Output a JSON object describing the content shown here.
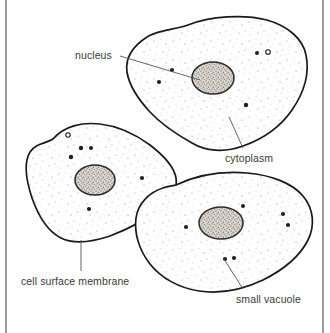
{
  "figure": {
    "background_color": "#ffffff",
    "ink_color": "#1a1a1a",
    "label_color": "#3a3a3a",
    "nucleus_fill_color": "#b9b5ad",
    "stipple_color": "#8d8d8d",
    "scan_rule_color": "#6f6f6f"
  },
  "labels": {
    "nucleus": "nucleus",
    "cytoplasm": "cytoplasm",
    "cell_surface_membrane": "cell surface membrane",
    "small_vacuole": "small vacuole"
  },
  "cells": [
    {
      "name": "top-cell",
      "nucleus_center": [
        213,
        78
      ],
      "nucleus_radius": [
        21,
        16
      ],
      "vacuoles": [
        [
          172,
          70
        ],
        [
          159,
          82
        ],
        [
          257,
          53
        ],
        [
          268,
          52
        ],
        [
          246,
          105
        ]
      ]
    },
    {
      "name": "left-cell",
      "nucleus_center": [
        95,
        180
      ],
      "nucleus_radius": [
        20,
        15
      ],
      "vacuoles": [
        [
          68,
          135
        ],
        [
          81,
          148
        ],
        [
          71,
          157
        ],
        [
          90,
          148
        ],
        [
          142,
          178
        ],
        [
          89,
          209
        ]
      ]
    },
    {
      "name": "bottom-right-cell",
      "nucleus_center": [
        221,
        223
      ],
      "nucleus_radius": [
        22,
        16
      ],
      "vacuoles": [
        [
          186,
          227
        ],
        [
          243,
          206
        ],
        [
          283,
          214
        ],
        [
          288,
          225
        ],
        [
          225,
          259
        ],
        [
          234,
          258
        ]
      ]
    }
  ],
  "leader_lines": [
    {
      "name": "nucleus-leader",
      "from": [
        120,
        56
      ],
      "to": [
        200,
        80
      ]
    },
    {
      "name": "cytoplasm-leader",
      "from": [
        243,
        148
      ],
      "to": [
        229,
        117
      ]
    },
    {
      "name": "membrane-leader",
      "from": [
        81,
        271
      ],
      "to": [
        81,
        240
      ]
    },
    {
      "name": "small-vacuole-leader",
      "from": [
        243,
        289
      ],
      "to": [
        224,
        259
      ]
    }
  ]
}
